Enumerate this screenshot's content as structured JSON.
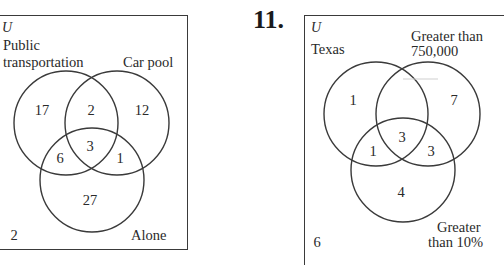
{
  "left_diagram": {
    "universe_label": "U",
    "sets": {
      "a": {
        "label_line1": "Public",
        "label_line2": "transportation"
      },
      "b": {
        "label": "Car pool"
      },
      "c": {
        "label": "Alone"
      }
    },
    "regions": {
      "a_only": "17",
      "a_and_b_only": "2",
      "b_only": "12",
      "a_b_c": "3",
      "a_and_c_only": "6",
      "b_and_c_only": "1",
      "c_only": "27",
      "outside": "2"
    }
  },
  "right_diagram": {
    "exercise_number": "11.",
    "universe_label": "U",
    "sets": {
      "a": {
        "label": "Texas"
      },
      "b": {
        "label_line1": "Greater than",
        "label_line2": "750,000"
      },
      "c": {
        "label_line1": "Greater",
        "label_line2": "than 10%"
      }
    },
    "regions": {
      "a_only": "1",
      "a_and_b_only": "",
      "b_only": "7",
      "a_b_c": "3",
      "a_and_c_only": "1",
      "b_and_c_only": "3",
      "c_only": "4",
      "outside": "6"
    }
  },
  "colors": {
    "stroke": "#3a3a3a",
    "text": "#2a2a2a",
    "background": "#ffffff"
  }
}
